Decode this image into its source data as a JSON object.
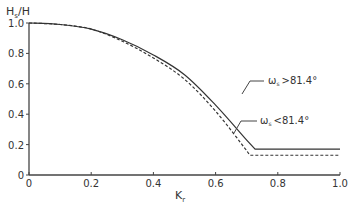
{
  "chart_data": {
    "type": "line",
    "title": "",
    "ylabel_main": "H",
    "ylabel_sub": "s",
    "ylabel_tail": "/H",
    "xlabel_main": "K",
    "xlabel_sub": "r",
    "xlim": [
      0,
      1.0
    ],
    "ylim": [
      0,
      1.0
    ],
    "xticks": [
      "0",
      "0.2",
      "0.4",
      "0.6",
      "0.8",
      "1.0"
    ],
    "xtick_values": [
      0,
      0.2,
      0.4,
      0.6,
      0.8,
      1.0
    ],
    "yticks": [
      "0",
      "0.2",
      "0.4",
      "0.6",
      "0.8",
      "1.0"
    ],
    "ytick_values": [
      0,
      0.2,
      0.4,
      0.6,
      0.8,
      1.0
    ],
    "grid": false,
    "series": [
      {
        "name": "ω_s > 81.4°",
        "style": "solid",
        "x": [
          0,
          0.1,
          0.2,
          0.3,
          0.4,
          0.5,
          0.6,
          0.7,
          0.727,
          1.0
        ],
        "y": [
          1.0,
          0.99,
          0.96,
          0.89,
          0.79,
          0.66,
          0.46,
          0.23,
          0.17,
          0.17
        ]
      },
      {
        "name": "ω_s < 81.4°",
        "style": "dashed",
        "x": [
          0,
          0.1,
          0.2,
          0.3,
          0.4,
          0.5,
          0.6,
          0.7,
          0.71,
          1.0
        ],
        "y": [
          1.0,
          0.99,
          0.96,
          0.88,
          0.77,
          0.63,
          0.42,
          0.16,
          0.13,
          0.13
        ]
      }
    ],
    "annotations": [
      {
        "symbol": "ω",
        "sub": "s",
        "text": ">81.4°",
        "target": "solid"
      },
      {
        "symbol": "ω",
        "sub": "s",
        "text": "<81.4°",
        "target": "dashed"
      }
    ]
  }
}
